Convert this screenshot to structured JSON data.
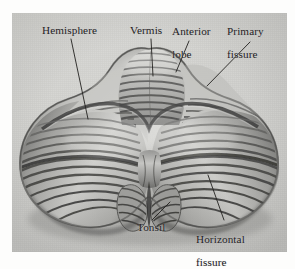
{
  "figure": {
    "kind": "anatomical-plate",
    "view": "posterior superior surface",
    "medium": "grayscale halftone illustration",
    "plate_background_color": "#d2d2cf",
    "page_background_color": "#fdfdfc",
    "ink_color": "#23211f"
  },
  "labels": [
    {
      "id": "hemisphere",
      "text": "Hemisphere",
      "lines": [
        "Hemisphere"
      ],
      "align": "left",
      "text_x": 42,
      "text_y": 25,
      "leader": {
        "x1": 71,
        "y1": 39,
        "x2": 88,
        "y2": 119
      }
    },
    {
      "id": "vermis",
      "text": "Vermis",
      "lines": [
        "Vermis"
      ],
      "align": "left",
      "text_x": 130,
      "text_y": 25,
      "leader": {
        "x1": 151,
        "y1": 39,
        "x2": 153,
        "y2": 76
      }
    },
    {
      "id": "anterior-lobe",
      "text": "Anterior lobe",
      "lines": [
        "Anterior",
        "lobe"
      ],
      "align": "left",
      "text_x": 172,
      "text_y": 14,
      "leader": {
        "x1": 189,
        "y1": 41,
        "x2": 176,
        "y2": 72
      }
    },
    {
      "id": "primary-fissure",
      "text": "Primary fissure",
      "lines": [
        "Primary",
        "fissure"
      ],
      "align": "left",
      "text_x": 227,
      "text_y": 14,
      "leader": {
        "x1": 250,
        "y1": 42,
        "x2": 207,
        "y2": 86
      }
    },
    {
      "id": "tonsil",
      "text": "Tonsil",
      "lines": [
        "Tonsil"
      ],
      "align": "left",
      "text_x": 137,
      "text_y": 222,
      "leader": {
        "x1": 152,
        "y1": 220,
        "x2": 170,
        "y2": 202
      }
    },
    {
      "id": "horizontal-fissure",
      "text": "Horizontal fissure",
      "lines": [
        "Horizontal",
        "fissure"
      ],
      "align": "left",
      "text_x": 196,
      "text_y": 222,
      "leader": {
        "x1": 224,
        "y1": 220,
        "x2": 208,
        "y2": 175
      }
    }
  ],
  "label_text": {
    "hemisphere": "Hemisphere",
    "vermis": "Vermis",
    "anterior_lobe_line1": "Anterior",
    "anterior_lobe_line2": "lobe",
    "primary_fissure_line1": "Primary",
    "primary_fissure_line2": "fissure",
    "tonsil": "Tonsil",
    "horizontal_fissure_line1": "Horizontal",
    "horizontal_fissure_line2": "fissure"
  }
}
